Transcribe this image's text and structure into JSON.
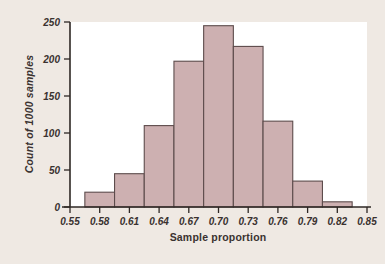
{
  "figure": {
    "background_color": "#efe9e3",
    "plot_background_color": "#ffffff",
    "bar_fill_color": "#cdb0b1",
    "bar_edge_color": "#5d4c4c",
    "axis_color": "#2e2724"
  },
  "chart_data": {
    "type": "bar",
    "title": "",
    "xlabel": "Sample proportion",
    "ylabel": "Count of 1000 samples",
    "xlim": [
      0.55,
      0.85
    ],
    "ylim": [
      0,
      250
    ],
    "grid": false,
    "legend": null,
    "bin_width": 0.03,
    "xticks": [
      "0.55",
      "0.58",
      "0.61",
      "0.64",
      "0.67",
      "0.70",
      "0.73",
      "0.76",
      "0.79",
      "0.82",
      "0.85"
    ],
    "xtick_values": [
      0.55,
      0.58,
      0.61,
      0.64,
      0.67,
      0.7,
      0.73,
      0.76,
      0.79,
      0.82,
      0.85
    ],
    "yticks": [
      "0",
      "50",
      "100",
      "150",
      "200",
      "250"
    ],
    "ytick_values": [
      0,
      50,
      100,
      150,
      200,
      250
    ],
    "bins": [
      {
        "left": 0.565,
        "right": 0.595,
        "count": 20
      },
      {
        "left": 0.595,
        "right": 0.625,
        "count": 45
      },
      {
        "left": 0.625,
        "right": 0.655,
        "count": 110
      },
      {
        "left": 0.655,
        "right": 0.685,
        "count": 197
      },
      {
        "left": 0.685,
        "right": 0.715,
        "count": 245
      },
      {
        "left": 0.715,
        "right": 0.745,
        "count": 217
      },
      {
        "left": 0.745,
        "right": 0.775,
        "count": 116
      },
      {
        "left": 0.775,
        "right": 0.805,
        "count": 35
      },
      {
        "left": 0.805,
        "right": 0.835,
        "count": 7
      }
    ],
    "categories": [
      "0.565-0.595",
      "0.595-0.625",
      "0.625-0.655",
      "0.655-0.685",
      "0.685-0.715",
      "0.715-0.745",
      "0.745-0.775",
      "0.775-0.805",
      "0.805-0.835"
    ],
    "values": [
      20,
      45,
      110,
      197,
      245,
      217,
      116,
      35,
      7
    ]
  }
}
